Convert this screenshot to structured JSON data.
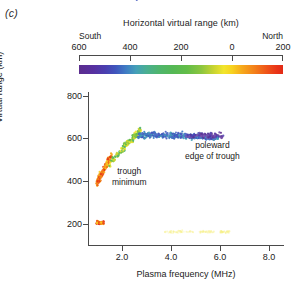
{
  "panel": {
    "label": "(c)"
  },
  "colorbar": {
    "title": "Horizontal virtual range (km)",
    "left_direction": "South",
    "right_direction": "North",
    "ticks": [
      {
        "label": "600",
        "pos": 0.0
      },
      {
        "label": "400",
        "pos": 0.25
      },
      {
        "label": "200",
        "pos": 0.5
      },
      {
        "label": "0",
        "pos": 0.75
      },
      {
        "label": "200",
        "pos": 1.0
      }
    ],
    "gradient_stops": [
      "#5b2d8e",
      "#3f56bd",
      "#44a0b8",
      "#55b855",
      "#c8d431",
      "#f7d21f",
      "#f3801a",
      "#e22a16"
    ]
  },
  "axes": {
    "ylabel": "Virtual range (km)",
    "xlabel": "Plasma frequency (MHz)",
    "yticks": [
      "800",
      "600",
      "400",
      "200"
    ],
    "xticks": [
      "2.0",
      "4.0",
      "6.0",
      "8.0"
    ]
  },
  "annotations": {
    "trough_minimum": "trough\nminimum",
    "trough_minimum_line1": "trough",
    "trough_minimum_line2": "minimum",
    "poleward_line1": "poleward",
    "poleward_line2": "edge of trough"
  },
  "chart_data": {
    "type": "scatter",
    "title": "",
    "xlabel": "Plasma frequency (MHz)",
    "ylabel": "Virtual range (km)",
    "xlim": [
      0.6,
      8.6
    ],
    "ylim": [
      100,
      820
    ],
    "xticks": [
      2.0,
      4.0,
      6.0,
      8.0
    ],
    "yticks": [
      200,
      400,
      600,
      800
    ],
    "grid": false,
    "legend": "none",
    "colorbar": {
      "label": "Horizontal virtual range (km)",
      "min_label": "600",
      "max_label": "200",
      "left_direction": "South",
      "right_direction": "North",
      "tick_values": [
        600,
        400,
        200,
        0,
        -200
      ]
    },
    "annotations": [
      {
        "text": "trough minimum",
        "x": 1.75,
        "y": 395
      },
      {
        "text": "poleward edge of trough",
        "x": 5.2,
        "y": 470
      }
    ],
    "clusters": [
      {
        "name": "trough-minimum-limb",
        "color_family": "red-orange",
        "x_range": [
          0.95,
          1.55
        ],
        "y_range": [
          390,
          520
        ],
        "n_points": 150,
        "colors": [
          "#e53219",
          "#ef5a19",
          "#f4811b",
          "#f6a81b",
          "#f7c81f"
        ]
      },
      {
        "name": "ascending-green-limb",
        "color_family": "yellow-green",
        "x_range": [
          1.45,
          2.75
        ],
        "y_range": [
          470,
          640
        ],
        "n_points": 170,
        "colors": [
          "#f2e52c",
          "#c8d431",
          "#8cc63f",
          "#63bd48",
          "#4fb56e"
        ]
      },
      {
        "name": "plateau-blue-core",
        "color_family": "blue",
        "x_range": [
          2.6,
          5.9
        ],
        "y_range": [
          570,
          665
        ],
        "n_points": 430,
        "colors": [
          "#44a0b8",
          "#3f7cc4",
          "#3f56bd",
          "#4a5fc0",
          "#5a6ec8"
        ]
      },
      {
        "name": "poleward-tail-violet",
        "color_family": "violet",
        "x_range": [
          4.6,
          6.1
        ],
        "y_range": [
          580,
          650
        ],
        "n_points": 90,
        "colors": [
          "#5b2d8e",
          "#6a43a5",
          "#7b55b0",
          "#4a3fb0"
        ]
      },
      {
        "name": "low-range-cluster",
        "color_family": "red-orange",
        "x_range": [
          0.95,
          1.25
        ],
        "y_range": [
          185,
          225
        ],
        "n_points": 45,
        "colors": [
          "#e22a16",
          "#ef5419",
          "#f3801a",
          "#f7d21f"
        ]
      },
      {
        "name": "faint-yellow-streaks",
        "color_family": "pale-yellow",
        "x_range": [
          3.7,
          6.4
        ],
        "y_range": [
          150,
          185
        ],
        "n_points": 120,
        "colors": [
          "#f7f18a",
          "#faf6b0",
          "#f5ee7a"
        ]
      }
    ]
  }
}
